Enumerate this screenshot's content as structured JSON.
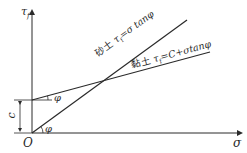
{
  "diagram": {
    "type": "mohr-coulomb-shear-strength",
    "axes": {
      "y_label": "τ",
      "y_label_sub": "f",
      "x_label": "σ",
      "origin_label": "O"
    },
    "lines": [
      {
        "name": "sand",
        "label_prefix": "砂土",
        "label_formula": "τ",
        "label_sub": "f",
        "label_rest": "=σ tanφ",
        "angle_label": "φ"
      },
      {
        "name": "clay",
        "label_prefix": "黏土",
        "label_formula": "τ",
        "label_sub": "f",
        "label_rest": "=C+σtanφ",
        "angle_label": "φ"
      }
    ],
    "intercept_label": "c",
    "colors": {
      "line": "#2a2a2a",
      "background": "#ffffff"
    }
  }
}
